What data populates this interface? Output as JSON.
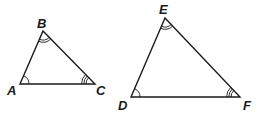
{
  "diagram": {
    "triangles": [
      {
        "name": "ABC",
        "vertices": [
          {
            "label": "A",
            "angle_marks": 1
          },
          {
            "label": "B",
            "angle_marks": 2
          },
          {
            "label": "C",
            "angle_marks": 3
          }
        ]
      },
      {
        "name": "DEF",
        "vertices": [
          {
            "label": "D",
            "angle_marks": 1
          },
          {
            "label": "E",
            "angle_marks": 2
          },
          {
            "label": "F",
            "angle_marks": 3
          }
        ]
      }
    ],
    "colors": {
      "stroke": "#1a1a1a",
      "background": "#ffffff"
    }
  }
}
